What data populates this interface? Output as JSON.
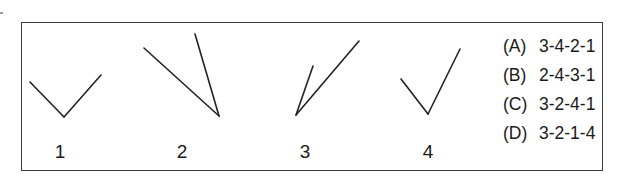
{
  "question": {
    "figures": [
      {
        "label": "1",
        "shape": "V-angle",
        "segments": [
          [
            30,
            82,
            64,
            117
          ],
          [
            64,
            117,
            101,
            75
          ]
        ],
        "label_x": 45
      },
      {
        "label": "2",
        "shape": "narrow-angle-vertex-bottom-right",
        "segments": [
          [
            144,
            48,
            219,
            116
          ],
          [
            195,
            34,
            219,
            116
          ]
        ],
        "label_x": 167
      },
      {
        "label": "3",
        "shape": "acute-angle-vertex-bottom-left",
        "segments": [
          [
            296,
            115,
            313,
            66
          ],
          [
            296,
            115,
            359,
            41
          ]
        ],
        "label_x": 290
      },
      {
        "label": "4",
        "shape": "checkmark-angle",
        "segments": [
          [
            401,
            79,
            428,
            114
          ],
          [
            428,
            114,
            460,
            49
          ]
        ],
        "label_x": 413
      }
    ],
    "options": [
      {
        "letter": "(A)",
        "text": "3-4-2-1"
      },
      {
        "letter": "(B)",
        "text": "2-4-3-1"
      },
      {
        "letter": "(C)",
        "text": "3-2-4-1"
      },
      {
        "letter": "(D)",
        "text": "3-2-1-4"
      }
    ]
  }
}
